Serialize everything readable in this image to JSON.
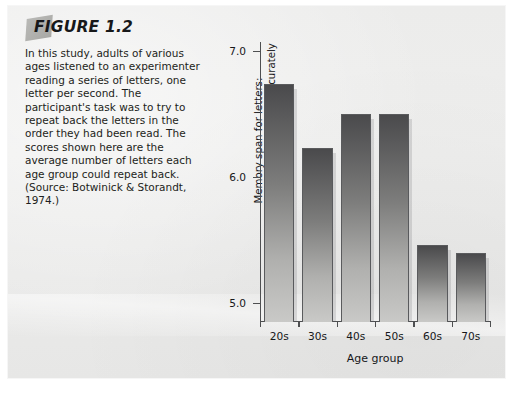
{
  "figure": {
    "title": "FIGURE 1.2",
    "caption": "In this study, adults of various ages listened to an experimenter reading a series of letters, one letter per second. The participant's task was to try to repeat back the letters in the order they had been read. The scores shown here are the average number of letters each age group could repeat back. (Source: Botwinick & Storandt, 1974.)"
  },
  "chart_data": {
    "type": "bar",
    "title": "",
    "categories": [
      "20s",
      "30s",
      "40s",
      "50s",
      "60s",
      "70s"
    ],
    "values": [
      6.74,
      6.23,
      6.5,
      6.5,
      5.46,
      5.4
    ],
    "xlabel": "Age group",
    "ylabel": "Memory span for letters:\nnumber of letters repeated accurately",
    "ylim": [
      4.85,
      7.15
    ],
    "yticks": [
      5.0,
      6.0,
      7.0
    ],
    "ytick_labels": [
      "5.0",
      "6.0",
      "7.0"
    ],
    "grid": false,
    "legend": null,
    "bar_fill_top": "#4a4a4c",
    "bar_fill_bottom": "#c9c9c7",
    "bar_border": "#5a5b5d",
    "axis_color": "#4e4f51",
    "background": "#ececeb"
  }
}
